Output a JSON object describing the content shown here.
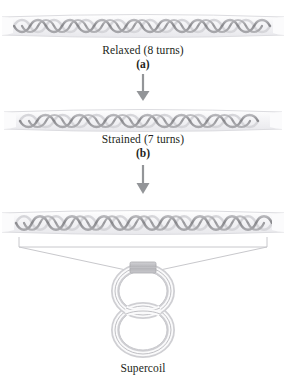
{
  "figure": {
    "panels": [
      {
        "id": "panel-a",
        "helix_label": "Relaxed helix, 8 turns",
        "caption": "Relaxed (8 turns)",
        "letter": "(a)",
        "turns": 8
      },
      {
        "id": "panel-b",
        "helix_label": "Strained helix, 7 turns",
        "caption": "Strained (7 turns)",
        "letter": "(b)",
        "turns": 7
      },
      {
        "id": "panel-c",
        "helix_label": "Supercoiled helix",
        "caption": "Supercoil",
        "letter": "",
        "turns": 8
      }
    ],
    "arrows": [
      {
        "id": "arrow-a-to-b",
        "direction": "down"
      },
      {
        "id": "arrow-b-to-c",
        "direction": "down"
      }
    ],
    "supercoil": {
      "shape": "figure-eight",
      "crossing_block_label": "crossing point"
    },
    "colors": {
      "strand_dark": "#8c8c8f",
      "strand_light": "#d8d8dc",
      "tube_fill": "#f4f4f6",
      "tube_edge": "#d2d2d6",
      "arrow": "#939598",
      "bracket_line": "#c8c8cc",
      "text": "#231f20",
      "block_fill": "#b9b9bd",
      "background": "#ffffff"
    }
  }
}
